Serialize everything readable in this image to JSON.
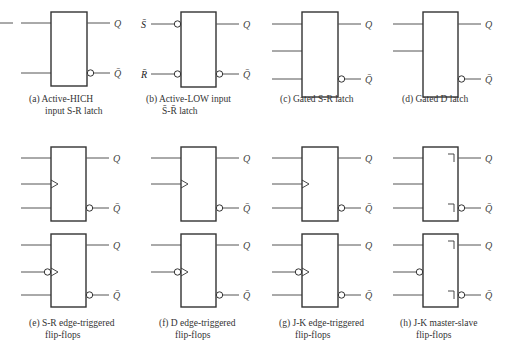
{
  "symbols": [
    {
      "id": "a",
      "caption": [
        "(a)  Active-HICH",
        "input S-R latch"
      ],
      "col": 0,
      "box": {
        "x": 51,
        "y": 12,
        "w": 36,
        "h": 74
      },
      "inputs": [
        {
          "label": "S",
          "y": 23,
          "invert": false,
          "ext": ""
        },
        {
          "label": "R",
          "y": 73,
          "invert": false,
          "ext": ""
        }
      ],
      "outputs": [
        {
          "label": "Q",
          "y": 23,
          "invert": false
        },
        {
          "label": "Q̄",
          "y": 73,
          "invert": true
        }
      ]
    },
    {
      "id": "b",
      "caption": [
        "(b)  Active-LOW input",
        "S̄-R̄ latch"
      ],
      "col": 1,
      "box": {
        "x": 181,
        "y": 12,
        "w": 35,
        "h": 75
      },
      "inputs": [
        {
          "label": "S",
          "y": 24,
          "invert": true,
          "ext": "S̄"
        },
        {
          "label": "R",
          "y": 74,
          "invert": true,
          "ext": "R̄"
        }
      ],
      "outputs": [
        {
          "label": "Q",
          "y": 24,
          "invert": false
        },
        {
          "label": "Q̄",
          "y": 74,
          "invert": true
        }
      ]
    },
    {
      "id": "c",
      "caption": [
        "(c)  Gated S-R latch"
      ],
      "col": 2,
      "box": {
        "x": 302,
        "y": 12,
        "w": 36,
        "h": 85
      },
      "inputs": [
        {
          "label": "S",
          "y": 24,
          "invert": false,
          "ext": ""
        },
        {
          "label": "EN",
          "y": 51,
          "invert": false,
          "ext": ""
        },
        {
          "label": "R",
          "y": 79,
          "invert": false,
          "ext": ""
        }
      ],
      "outputs": [
        {
          "label": "Q",
          "y": 24,
          "invert": false
        },
        {
          "label": "Q̄",
          "y": 79,
          "invert": true
        }
      ]
    },
    {
      "id": "d",
      "caption": [
        "(d)  Gated D latch"
      ],
      "col": 3,
      "box": {
        "x": 423,
        "y": 12,
        "w": 35,
        "h": 85
      },
      "inputs": [
        {
          "label": "D",
          "y": 24,
          "invert": false,
          "ext": ""
        },
        {
          "label": "EN",
          "y": 51,
          "invert": false,
          "ext": ""
        }
      ],
      "outputs": [
        {
          "label": "Q",
          "y": 24,
          "invert": false
        },
        {
          "label": "Q̄",
          "y": 79,
          "invert": true
        }
      ]
    },
    {
      "id": "e1",
      "col": 0,
      "box": {
        "x": 51,
        "y": 147,
        "w": 35,
        "h": 74
      },
      "inputs": [
        {
          "label": "S",
          "y": 158,
          "invert": false,
          "ext": ""
        },
        {
          "label": "C",
          "y": 184,
          "invert": false,
          "clock": true,
          "ext": ""
        },
        {
          "label": "R",
          "y": 208,
          "invert": false,
          "ext": ""
        }
      ],
      "outputs": [
        {
          "label": "Q",
          "y": 158,
          "invert": false
        },
        {
          "label": "Q̄",
          "y": 208,
          "invert": true
        }
      ]
    },
    {
      "id": "e2",
      "caption": [
        "(e)  S-R edge-triggered",
        "flip-flops"
      ],
      "col": 0,
      "box": {
        "x": 51,
        "y": 234,
        "w": 35,
        "h": 73
      },
      "inputs": [
        {
          "label": "S",
          "y": 245,
          "invert": false,
          "ext": ""
        },
        {
          "label": "C",
          "y": 272,
          "invert": true,
          "clock": true,
          "ext": ""
        },
        {
          "label": "R",
          "y": 295,
          "invert": false,
          "ext": ""
        }
      ],
      "outputs": [
        {
          "label": "Q",
          "y": 245,
          "invert": false
        },
        {
          "label": "Q̄",
          "y": 295,
          "invert": true
        }
      ]
    },
    {
      "id": "f1",
      "col": 1,
      "box": {
        "x": 181,
        "y": 147,
        "w": 35,
        "h": 74
      },
      "inputs": [
        {
          "label": "D",
          "y": 158,
          "invert": false,
          "ext": ""
        },
        {
          "label": "C",
          "y": 184,
          "invert": false,
          "clock": true,
          "ext": ""
        }
      ],
      "outputs": [
        {
          "label": "Q",
          "y": 158,
          "invert": false
        },
        {
          "label": "Q̄",
          "y": 208,
          "invert": true
        }
      ]
    },
    {
      "id": "f2",
      "caption": [
        "(f)  D edge-triggered",
        "flip-flops"
      ],
      "col": 1,
      "box": {
        "x": 181,
        "y": 234,
        "w": 35,
        "h": 73
      },
      "inputs": [
        {
          "label": "D",
          "y": 245,
          "invert": false,
          "ext": ""
        },
        {
          "label": "C",
          "y": 272,
          "invert": true,
          "clock": true,
          "ext": ""
        }
      ],
      "outputs": [
        {
          "label": "Q",
          "y": 245,
          "invert": false
        },
        {
          "label": "Q̄",
          "y": 295,
          "invert": true
        }
      ]
    },
    {
      "id": "g1",
      "col": 2,
      "box": {
        "x": 302,
        "y": 147,
        "w": 36,
        "h": 74
      },
      "inputs": [
        {
          "label": "J",
          "y": 158,
          "invert": false,
          "ext": ""
        },
        {
          "label": "C",
          "y": 184,
          "invert": false,
          "clock": true,
          "ext": ""
        },
        {
          "label": "K",
          "y": 208,
          "invert": false,
          "ext": ""
        }
      ],
      "outputs": [
        {
          "label": "Q",
          "y": 158,
          "invert": false
        },
        {
          "label": "Q̄",
          "y": 208,
          "invert": true
        }
      ]
    },
    {
      "id": "g2",
      "caption": [
        "(g)  J-K edge-triggered",
        "flip-flops"
      ],
      "col": 2,
      "box": {
        "x": 302,
        "y": 234,
        "w": 36,
        "h": 73
      },
      "inputs": [
        {
          "label": "J",
          "y": 245,
          "invert": false,
          "ext": ""
        },
        {
          "label": "C",
          "y": 272,
          "invert": true,
          "clock": true,
          "ext": ""
        },
        {
          "label": "K",
          "y": 295,
          "invert": false,
          "ext": ""
        }
      ],
      "outputs": [
        {
          "label": "Q",
          "y": 245,
          "invert": false
        },
        {
          "label": "Q̄",
          "y": 295,
          "invert": true
        }
      ]
    },
    {
      "id": "h1",
      "col": 3,
      "box": {
        "x": 423,
        "y": 147,
        "w": 35,
        "h": 74
      },
      "postponed": true,
      "inputs": [
        {
          "label": "J",
          "y": 158,
          "invert": false,
          "ext": ""
        },
        {
          "label": "C",
          "y": 184,
          "invert": false,
          "clock": false,
          "ext": ""
        },
        {
          "label": "K",
          "y": 208,
          "invert": false,
          "ext": ""
        }
      ],
      "outputs": [
        {
          "label": "Q",
          "y": 158,
          "invert": false
        },
        {
          "label": "Q̄",
          "y": 208,
          "invert": true
        }
      ]
    },
    {
      "id": "h2",
      "caption": [
        "(h)  J-K master-slave",
        "flip-flops"
      ],
      "col": 3,
      "box": {
        "x": 423,
        "y": 234,
        "w": 35,
        "h": 73
      },
      "postponed": true,
      "inputs": [
        {
          "label": "J",
          "y": 245,
          "invert": false,
          "ext": ""
        },
        {
          "label": "C",
          "y": 272,
          "invert": true,
          "clock": false,
          "ext": ""
        },
        {
          "label": "K",
          "y": 295,
          "invert": false,
          "ext": ""
        }
      ],
      "outputs": [
        {
          "label": "Q",
          "y": 245,
          "invert": false
        },
        {
          "label": "Q̄",
          "y": 295,
          "invert": true
        }
      ]
    }
  ],
  "captions": {
    "a": [
      "(a)  Active-HICH",
      "input S-R latch"
    ],
    "b": [
      "(b)  Active-LOW input",
      "S̄-R̄ latch"
    ],
    "c": [
      "(c)  Gated S-R latch"
    ],
    "d": [
      "(d)  Gated D latch"
    ],
    "e": [
      "(e)  S-R edge-triggered",
      "flip-flops"
    ],
    "f": [
      "(f)  D edge-triggered",
      "flip-flops"
    ],
    "g": [
      "(g)  J-K edge-triggered",
      "flip-flops"
    ],
    "h": [
      "(h)  J-K master-slave",
      "flip-flops"
    ]
  },
  "caption_positions": {
    "a": {
      "x": 29,
      "y": 102
    },
    "b": {
      "x": 146,
      "y": 102
    },
    "c": {
      "x": 280,
      "y": 102
    },
    "d": {
      "x": 402,
      "y": 102
    },
    "e": {
      "x": 29,
      "y": 326
    },
    "f": {
      "x": 159,
      "y": 326
    },
    "g": {
      "x": 279,
      "y": 326
    },
    "h": {
      "x": 400,
      "y": 326
    }
  },
  "stray_line": {
    "x1": 0,
    "x2": 13,
    "y": 23
  }
}
